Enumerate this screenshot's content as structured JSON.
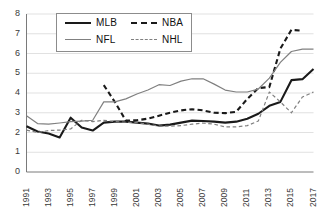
{
  "chart_data": {
    "type": "line",
    "title": "",
    "xlabel": "",
    "ylabel": "",
    "xlim": [
      1991,
      2017
    ],
    "ylim": [
      0,
      8
    ],
    "ytick_step": 1,
    "grid": "horizontal",
    "legend_position": "top-center",
    "y_ticks": [
      "8",
      "7",
      "6",
      "5",
      "4",
      "3",
      "2",
      "1",
      "0"
    ],
    "x_ticks": [
      "1991",
      "1993",
      "1995",
      "1997",
      "1999",
      "2001",
      "2003",
      "2005",
      "2007",
      "2009",
      "2011",
      "2013",
      "2015",
      "2017"
    ],
    "x_all_years": [
      1991,
      1992,
      1993,
      1994,
      1995,
      1996,
      1997,
      1998,
      1999,
      2000,
      2001,
      2002,
      2003,
      2004,
      2005,
      2006,
      2007,
      2008,
      2009,
      2010,
      2011,
      2012,
      2013,
      2014,
      2015,
      2016,
      2017
    ],
    "series": [
      {
        "name": "MLB",
        "style": "solid",
        "color": "#1a1a1a",
        "width": 2.1,
        "x": [
          1991,
          1992,
          1993,
          1994,
          1995,
          1996,
          1997,
          1998,
          1999,
          2000,
          2001,
          2002,
          2003,
          2004,
          2005,
          2006,
          2007,
          2008,
          2009,
          2010,
          2011,
          2012,
          2013,
          2014,
          2015,
          2016,
          2017
        ],
        "values": [
          2.32,
          2.05,
          1.95,
          1.75,
          2.75,
          2.25,
          2.1,
          2.5,
          2.55,
          2.55,
          2.5,
          2.45,
          2.35,
          2.4,
          2.5,
          2.6,
          2.58,
          2.55,
          2.5,
          2.55,
          2.7,
          2.95,
          3.35,
          3.55,
          4.65,
          4.7,
          5.22
        ]
      },
      {
        "name": "NBA",
        "style": "dashed",
        "color": "#1a1a1a",
        "width": 2.1,
        "x": [
          1998,
          1999,
          2000,
          2001,
          2002,
          2003,
          2004,
          2005,
          2006,
          2007,
          2008,
          2009,
          2010,
          2011,
          2012,
          2013,
          2014,
          2015,
          2016
        ],
        "values": [
          4.4,
          3.55,
          2.6,
          2.62,
          2.7,
          2.85,
          3.0,
          3.12,
          3.18,
          3.12,
          3.0,
          2.98,
          3.05,
          3.7,
          4.25,
          4.3,
          6.25,
          7.2,
          7.15
        ]
      },
      {
        "name": "NFL",
        "style": "solid",
        "color": "#808080",
        "width": 1.2,
        "x": [
          1991,
          1992,
          1993,
          1994,
          1995,
          1996,
          1997,
          1998,
          1999,
          2000,
          2001,
          2002,
          2003,
          2004,
          2005,
          2006,
          2007,
          2008,
          2009,
          2010,
          2011,
          2012,
          2013,
          2014,
          2015,
          2016,
          2017
        ],
        "values": [
          2.85,
          2.45,
          2.42,
          2.48,
          2.55,
          2.58,
          2.62,
          3.55,
          3.55,
          3.7,
          3.95,
          4.15,
          4.42,
          4.38,
          4.6,
          4.72,
          4.72,
          4.45,
          4.15,
          4.05,
          4.05,
          4.2,
          4.75,
          5.55,
          6.1,
          6.22,
          6.22
        ]
      },
      {
        "name": "NHL",
        "style": "dashed",
        "color": "#808080",
        "width": 1.2,
        "x": [
          1991,
          1992,
          1993,
          1994,
          1995,
          1996,
          1997,
          1998,
          1999,
          2000,
          2001,
          2002,
          2003,
          2004,
          2005,
          2006,
          2007,
          2008,
          2009,
          2010,
          2011,
          2012,
          2013,
          2014,
          2015,
          2016,
          2017
        ],
        "values": [
          2.12,
          2.0,
          2.1,
          2.12,
          2.18,
          2.62,
          2.55,
          2.62,
          2.55,
          2.52,
          2.5,
          2.42,
          2.32,
          2.32,
          2.35,
          2.42,
          2.48,
          2.42,
          2.28,
          2.28,
          2.35,
          2.58,
          4.05,
          3.55,
          3.0,
          3.8,
          4.05
        ]
      }
    ]
  },
  "legend": {
    "items": [
      {
        "label": "MLB",
        "style": "solid",
        "color": "#1a1a1a",
        "width": 2.1
      },
      {
        "label": "NBA",
        "style": "dashed",
        "color": "#1a1a1a",
        "width": 2.1
      },
      {
        "label": "NFL",
        "style": "solid",
        "color": "#808080",
        "width": 1.2
      },
      {
        "label": "NHL",
        "style": "dashed",
        "color": "#808080",
        "width": 1.2
      }
    ]
  },
  "colors": {
    "background": "#ffffff",
    "gridline": "#d9d9d9",
    "axis": "#7a7a7a",
    "tick_text": "#3a3a3a",
    "legend_border": "#8c8c8c"
  }
}
